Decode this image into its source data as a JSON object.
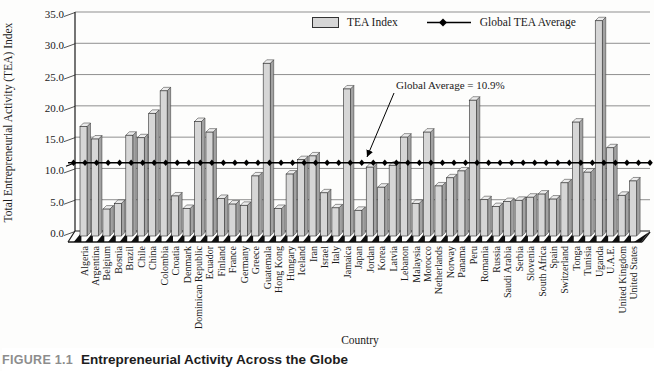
{
  "figure": {
    "caption_label": "FIGURE 1.1",
    "caption_title": "Entrepreneurial Activity Across the Globe"
  },
  "legend": {
    "bar_label": "TEA Index",
    "line_label": "Global TEA Average"
  },
  "annotation": {
    "text": "Global Average = 10.9%"
  },
  "colors": {
    "bar_front": "#d6d6d6",
    "bar_top": "#ececec",
    "bar_side": "#a2a2a2",
    "bar_stroke": "#2e2e2e",
    "grid": "#8f8f8f",
    "axis": "#1a1a1a",
    "avg_line": "#000000",
    "teeth": "#0d0d0d",
    "caption_label": "#8d8d8d",
    "caption_title": "#1d1d1d",
    "text": "#1a1a1a"
  },
  "chart_data": {
    "type": "bar",
    "title": "",
    "xlabel": "Country",
    "ylabel": "Total Entrepreneurial Activity (TEA) Index",
    "ylim": [
      0,
      35
    ],
    "ytick_step": 5,
    "yticks": [
      "0.0",
      "5.0",
      "10.0",
      "15.0",
      "20.0",
      "25.0",
      "30.0",
      "35.0"
    ],
    "grid": true,
    "legend_position": "top-center",
    "global_average": 10.9,
    "series_name": "TEA Index",
    "line_series_name": "Global TEA Average",
    "categories": [
      "Algeria",
      "Argentina",
      "Belgium",
      "Bosnia",
      "Brazil",
      "Chile",
      "China",
      "Colombia",
      "Croatia",
      "Denmark",
      "Dominican Republic",
      "Ecuador",
      "Finland",
      "France",
      "Germany",
      "Greece",
      "Guatemala",
      "Hong Kong",
      "Hungary",
      "Iceland",
      "Iran",
      "Israel",
      "Italy",
      "Jamaica",
      "Japan",
      "Jordan",
      "Korea",
      "Latvia",
      "Lebanon",
      "Malaysia",
      "Morocco",
      "Netherlands",
      "Norway",
      "Panama",
      "Peru",
      "Romania",
      "Russia",
      "Saudi Arabia",
      "Serbia",
      "Slovenia",
      "South Africa",
      "Spain",
      "Switzerland",
      "Tonga",
      "Tunisia",
      "Uganda",
      "U.A.E.",
      "United Kingdom",
      "United States"
    ],
    "values": [
      16.7,
      14.7,
      3.5,
      4.4,
      15.3,
      14.9,
      18.8,
      22.4,
      5.6,
      3.6,
      17.5,
      15.8,
      5.2,
      4.3,
      4.1,
      8.8,
      26.8,
      3.6,
      9.1,
      11.4,
      12.0,
      6.1,
      3.7,
      22.7,
      3.3,
      10.2,
      7.0,
      10.5,
      15.0,
      4.4,
      15.8,
      7.2,
      8.5,
      9.6,
      20.9,
      5.0,
      3.9,
      4.7,
      4.9,
      5.4,
      5.9,
      5.1,
      7.7,
      17.4,
      9.4,
      33.6,
      13.3,
      5.7,
      8.0
    ]
  }
}
